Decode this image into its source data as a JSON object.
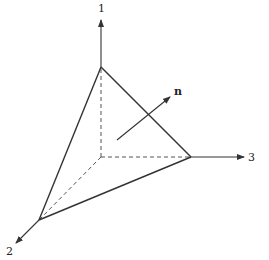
{
  "diagram": {
    "axes": [
      {
        "id": "axis-1",
        "label": "1"
      },
      {
        "id": "axis-2",
        "label": "2"
      },
      {
        "id": "axis-3",
        "label": "3"
      }
    ],
    "normal_vector": {
      "label": "n"
    },
    "colors": {
      "stroke": "#333333",
      "background": "#ffffff"
    }
  }
}
